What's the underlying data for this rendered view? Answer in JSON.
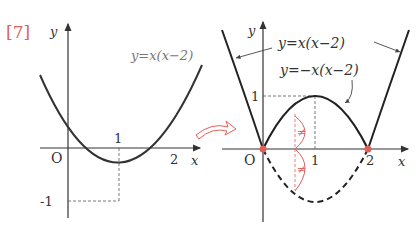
{
  "problem_number": "[7]",
  "colors": {
    "accent": "#e0605a",
    "curve": "#222222",
    "axis": "#333333",
    "label_gray": "#777777"
  },
  "left_graph": {
    "x_axis_label": "x",
    "y_axis_label": "y",
    "origin_label": "O",
    "x_ticks": [
      "1",
      "2"
    ],
    "y_ticks": [
      "-1"
    ],
    "curve_label": "y=x(x−2)"
  },
  "right_graph": {
    "x_axis_label": "x",
    "y_axis_label": "y",
    "origin_label": "O",
    "x_ticks": [
      "1",
      "2"
    ],
    "y_ticks": [
      "1"
    ],
    "curve_label_outer": "y=x(x−2)",
    "curve_label_inner": "y=−x(x−2)",
    "equal_mark": "≠"
  },
  "arrow": "transform-arrow"
}
